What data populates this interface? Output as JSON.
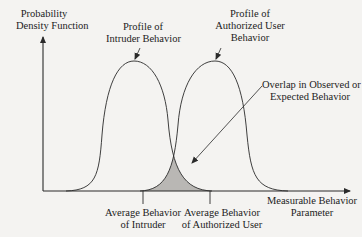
{
  "figure": {
    "y_axis_label": [
      "Probability",
      "Density Function"
    ],
    "x_axis_label": [
      "Measurable Behavior",
      "Parameter"
    ],
    "curves": [
      {
        "name": "intruder",
        "label": [
          "Profile of",
          "Intruder Behavior"
        ]
      },
      {
        "name": "authorized-user",
        "label": [
          "Profile of",
          "Authorized User",
          "Behavior"
        ]
      }
    ],
    "overlap_label": [
      "Overlap in Observed or",
      "Expected Behavior"
    ],
    "ticks": [
      {
        "label": [
          "Average Behavior",
          "of Intruder"
        ]
      },
      {
        "label": [
          "Average Behavior",
          "of Authorized User"
        ]
      }
    ],
    "colors": {
      "line": "#2a2a2a",
      "overlap_fill": "#b9b7b4",
      "background": "#f4f3f1"
    }
  }
}
